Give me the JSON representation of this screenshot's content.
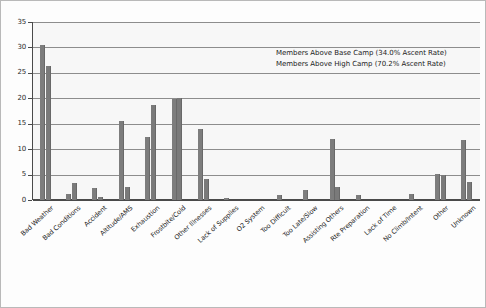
{
  "chart_data": {
    "type": "bar",
    "title": "",
    "subtitle": "",
    "xlabel": "",
    "ylabel": "",
    "ylim": [
      0,
      35
    ],
    "ytick_values": [
      0,
      5,
      10,
      15,
      20,
      25,
      30,
      35
    ],
    "ytick_labels": [
      "0",
      "5",
      "10",
      "15",
      "20",
      "25",
      "30",
      "35"
    ],
    "grid": true,
    "grid_axis": "y",
    "legend_position": "upper-right-inside",
    "bar_color": "#7d7d7d",
    "categories": [
      "Bad Weather",
      "Bad Conditions",
      "Accident",
      "Altitude/AMS",
      "Exhaustion",
      "Frostbite/Cold",
      "Other Illnesses",
      "Lack of Supplies",
      "O2 System",
      "Too Difficult",
      "Too Late/Slow",
      "Assisting Others",
      "Rte Preparation",
      "Lack of Time",
      "No Climb/Intent",
      "Other",
      "Unknown"
    ],
    "series": [
      {
        "name": "Members Above Base Camp (34.0% Ascent Rate)",
        "values": [
          30.4,
          1.1,
          2.3,
          15.6,
          12.4,
          19.8,
          14.0,
          0.3,
          0.0,
          0.9,
          1.9,
          12.0,
          0.9,
          0.0,
          1.2,
          5.2,
          11.8
        ]
      },
      {
        "name": "Members Above High Camp (70.2% Ascent Rate)",
        "values": [
          26.4,
          3.3,
          0.6,
          2.5,
          18.7,
          20.0,
          4.2,
          0.0,
          0.0,
          0.0,
          0.0,
          2.5,
          0.0,
          0.0,
          0.0,
          5.0,
          3.6
        ]
      }
    ]
  },
  "legend": {
    "line1": "Members Above Base Camp (34.0% Ascent Rate)",
    "line2": "Members Above High Camp (70.2% Ascent Rate)"
  }
}
